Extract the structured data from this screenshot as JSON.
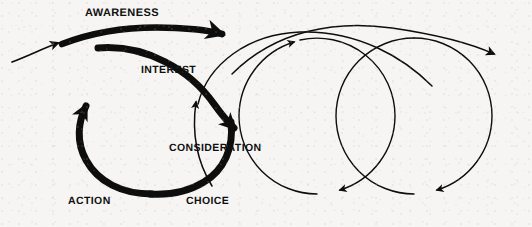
{
  "figure": {
    "kind": "loop-diagram",
    "title_text": "",
    "background_color": "#f6f5f3",
    "ink_color": "#0d0d0d"
  },
  "labels": [
    {
      "id": "awareness",
      "text": "AWARENESS",
      "x": 85,
      "y": 8,
      "size": 11
    },
    {
      "id": "interest",
      "text": "INTEREST",
      "x": 141,
      "y": 65,
      "size": 10.5
    },
    {
      "id": "consideration",
      "text": "CONSIDERATION",
      "x": 169,
      "y": 143,
      "size": 10.5
    },
    {
      "id": "action",
      "text": "ACTION",
      "x": 68,
      "y": 196,
      "size": 10.5
    },
    {
      "id": "choice",
      "text": "CHOICE",
      "x": 186,
      "y": 196,
      "size": 10.5
    }
  ],
  "stages": {
    "order": [
      "AWARENESS",
      "INTEREST",
      "CONSIDERATION",
      "CHOICE",
      "ACTION"
    ],
    "count": 5
  },
  "strokes": {
    "thick_weight": 7,
    "thin_weight": 1.4,
    "entry_weight": 1.6
  },
  "arrow_markers": [
    {
      "id": "entry-arrow",
      "x": 60,
      "y": 42,
      "direction": "up-right",
      "weight": "thin"
    },
    {
      "id": "awareness-arrow",
      "x": 228,
      "y": 28,
      "direction": "right",
      "weight": "thick"
    },
    {
      "id": "interest-arrow",
      "x": 241,
      "y": 128,
      "direction": "down-right",
      "weight": "thick"
    },
    {
      "id": "action-arrow",
      "x": 90,
      "y": 100,
      "direction": "up-right",
      "weight": "thick"
    },
    {
      "id": "consideration-up-arrow",
      "x": 197,
      "y": 100,
      "direction": "up",
      "weight": "thin"
    },
    {
      "id": "circle2-up-arrow",
      "x": 293,
      "y": 108,
      "direction": "up",
      "weight": "thin"
    },
    {
      "id": "circle2-down-arrow",
      "x": 341,
      "y": 123,
      "direction": "down",
      "weight": "thin"
    },
    {
      "id": "circle3-down-arrow",
      "x": 438,
      "y": 128,
      "direction": "down",
      "weight": "thin"
    },
    {
      "id": "exit-arrow",
      "x": 498,
      "y": 55,
      "direction": "right-down",
      "weight": "thin"
    }
  ],
  "circles": [
    {
      "id": "loop-main",
      "cx": 154,
      "cy": 115,
      "r": 78,
      "weight": "thick"
    },
    {
      "id": "loop-second",
      "cx": 317,
      "cy": 116,
      "r": 78,
      "weight": "thin"
    },
    {
      "id": "loop-third",
      "cx": 414,
      "cy": 116,
      "r": 78,
      "weight": "thin"
    }
  ]
}
